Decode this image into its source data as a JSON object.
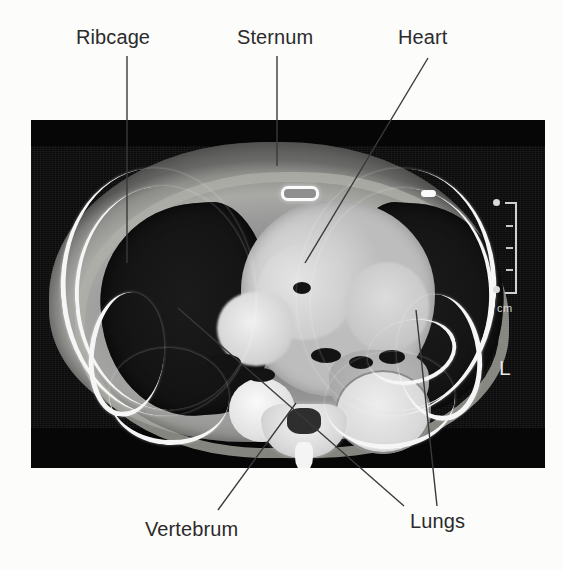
{
  "figure": {
    "kind": "annotated-medical-image",
    "modality": "CT",
    "view": "axial-thorax",
    "background_color": "#fcfcfb",
    "panel": {
      "background_color": "#0a0a0a",
      "x": 31,
      "y": 120,
      "width": 514,
      "height": 348
    }
  },
  "labels": [
    {
      "id": "ribcage",
      "text": "Ribcage"
    },
    {
      "id": "sternum",
      "text": "Sternum"
    },
    {
      "id": "heart",
      "text": "Heart"
    },
    {
      "id": "vertebrum",
      "text": "Vertebrum"
    },
    {
      "id": "lungs",
      "text": "Lungs"
    }
  ],
  "overlay": {
    "line_color": "#3a3a3a",
    "line_width": 1.4,
    "leaders": [
      {
        "for": "ribcage",
        "points": "127,56 127,263"
      },
      {
        "for": "sternum",
        "points": "277,56 277,166"
      },
      {
        "for": "heart",
        "points": "428,58 305,263"
      },
      {
        "for": "vertebrum",
        "points": "218,510 296,403"
      },
      {
        "for": "lungs-left",
        "points": "404,506 178,308"
      },
      {
        "for": "lungs-right",
        "points": "437,506 416,310"
      }
    ]
  },
  "image_markers": {
    "scale_ruler": {
      "unit_label": "cm",
      "tick_count": 3,
      "color": "#cfcfcf"
    },
    "side_marker": {
      "text": "L",
      "color": "#e4e4e4"
    },
    "arrow": {
      "direction": "left",
      "color": "#0d0d0d",
      "target": "lung-lesion"
    }
  },
  "anatomy": {
    "structures": [
      "body wall soft tissue",
      "subcutaneous fat rim",
      "right lung field",
      "left lung field",
      "heart chambers",
      "mediastinum great vessels",
      "descending aorta",
      "thoracic vertebra",
      "spinous process",
      "sternum",
      "rib cortical bone"
    ]
  }
}
